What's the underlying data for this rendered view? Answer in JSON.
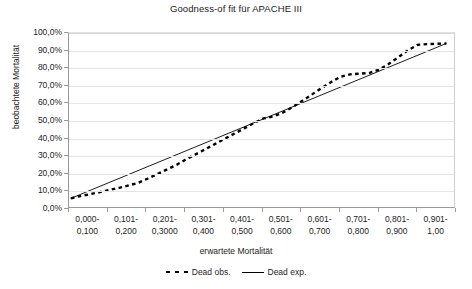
{
  "chart_data": {
    "type": "line",
    "title": "Goodness-of fit für APACHE III",
    "xlabel": "erwartete Mortalität",
    "ylabel": "beobachtete Mortalität",
    "grid": true,
    "legend_position": "bottom",
    "ylim": [
      0,
      100
    ],
    "y_unit": "%",
    "categories": [
      "0,000-0,100",
      "0,101-0,200",
      "0,201-0,3000",
      "0,301-0,400",
      "0,401-0,500",
      "0,501-0,600",
      "0,601-0,700",
      "0,701-0,800",
      "0,801-0,900",
      "0,901-1,00"
    ],
    "category_lines": [
      [
        "0,000-",
        "0,100"
      ],
      [
        "0,101-",
        "0,200"
      ],
      [
        "0,201-",
        "0,3000"
      ],
      [
        "0,301-",
        "0,400"
      ],
      [
        "0,401-",
        "0,500"
      ],
      [
        "0,501-",
        "0,600"
      ],
      [
        "0,601-",
        "0,700"
      ],
      [
        "0,701-",
        "0,800"
      ],
      [
        "0,801-",
        "0,900"
      ],
      [
        "0,901-",
        "1,00"
      ]
    ],
    "ytick_labels": [
      "100,0%",
      "90,0%",
      "80,0%",
      "70,0%",
      "60,0%",
      "50,0%",
      "40,0%",
      "30,0%",
      "20,0%",
      "10,0%",
      "0,0%"
    ],
    "ytick_values": [
      100,
      90,
      80,
      70,
      60,
      50,
      40,
      30,
      20,
      10,
      0
    ],
    "series": [
      {
        "name": "Dead obs.",
        "style": "dashed",
        "color": "#000000",
        "values": [
          5.0,
          11.5,
          24.5,
          35.0,
          47.5,
          56.0,
          70.5,
          77.0,
          90.5,
          94.0
        ]
      },
      {
        "name": "Dead exp.",
        "style": "solid",
        "color": "#000000",
        "values": [
          5.0,
          11.0,
          24.0,
          33.5,
          44.0,
          54.5,
          65.0,
          75.5,
          86.0,
          94.0
        ]
      }
    ],
    "series_detail": {
      "note": "Dense point-to-point traces read off the plot (x in fractional category units 0..9).",
      "dead_obs_points": [
        [
          0.05,
          5.0
        ],
        [
          0.3,
          6.3
        ],
        [
          0.55,
          7.4
        ],
        [
          0.8,
          8.5
        ],
        [
          1.05,
          9.8
        ],
        [
          1.3,
          11.0
        ],
        [
          1.55,
          12.4
        ],
        [
          1.8,
          13.9
        ],
        [
          2.05,
          16.4
        ],
        [
          2.3,
          19.0
        ],
        [
          2.55,
          21.6
        ],
        [
          2.8,
          24.3
        ],
        [
          3.05,
          27.5
        ],
        [
          3.3,
          30.4
        ],
        [
          3.55,
          33.3
        ],
        [
          3.8,
          36.3
        ],
        [
          4.05,
          39.3
        ],
        [
          4.3,
          42.2
        ],
        [
          4.55,
          45.2
        ],
        [
          4.8,
          48.2
        ],
        [
          5.05,
          50.9
        ],
        [
          5.3,
          52.0
        ],
        [
          5.55,
          54.2
        ],
        [
          5.8,
          57.4
        ],
        [
          6.05,
          60.9
        ],
        [
          6.3,
          64.5
        ],
        [
          6.55,
          68.2
        ],
        [
          6.8,
          71.7
        ],
        [
          7.05,
          74.8
        ],
        [
          7.3,
          76.2
        ],
        [
          7.55,
          76.6
        ],
        [
          7.8,
          77.0
        ],
        [
          8.05,
          78.9
        ],
        [
          8.3,
          82.2
        ],
        [
          8.55,
          86.0
        ],
        [
          8.8,
          90.0
        ],
        [
          9.05,
          93.2
        ],
        [
          9.3,
          93.6
        ],
        [
          9.55,
          93.8
        ],
        [
          9.8,
          94.0
        ]
      ],
      "dead_exp_points": [
        [
          0.05,
          5.0
        ],
        [
          9.8,
          94.0
        ]
      ]
    }
  },
  "legend": {
    "entries": [
      {
        "label": "Dead obs.",
        "swatch": "dashed-line-swatch"
      },
      {
        "label": "Dead exp.",
        "swatch": "solid-line-swatch"
      }
    ]
  }
}
